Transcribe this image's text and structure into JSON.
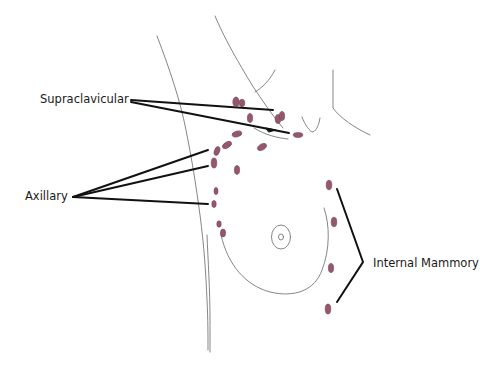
{
  "diagram": {
    "type": "anatomical-sketch",
    "labels": {
      "supraclavicular": "Supraclavicular",
      "axillary": "Axillary",
      "internal_mammory": "Internal Mammory"
    },
    "colors": {
      "background": "#ffffff",
      "node_fill": "#8c4a60",
      "node_stroke": "#6e3248",
      "leader_line": "#111111",
      "outline_sketch": "#777777",
      "label_text": "#1a1a1a"
    },
    "groups": [
      {
        "name": "Supraclavicular",
        "leader_lines": 2,
        "nodes": [
          [
            238,
            101
          ],
          [
            242,
            102
          ],
          [
            250,
            118
          ],
          [
            277,
            122
          ],
          [
            281,
            115
          ],
          [
            298,
            135
          ]
        ]
      },
      {
        "name": "Axillary",
        "leader_lines": 3,
        "nodes": [
          [
            213,
            152
          ],
          [
            226,
            145
          ],
          [
            237,
            135
          ],
          [
            213,
            164
          ],
          [
            237,
            170
          ],
          [
            262,
            147
          ],
          [
            216,
            192
          ],
          [
            214,
            204
          ],
          [
            219,
            226
          ],
          [
            223,
            233
          ]
        ]
      },
      {
        "name": "Internal Mammory",
        "leader_lines": 1,
        "bracket": true,
        "nodes": [
          [
            329,
            185
          ],
          [
            334,
            222
          ],
          [
            331,
            268
          ],
          [
            328,
            308
          ]
        ]
      }
    ]
  }
}
